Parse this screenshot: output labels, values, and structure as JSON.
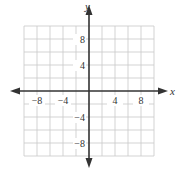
{
  "chart_data": {
    "type": "scatter",
    "title": "",
    "xlabel": "x",
    "ylabel": "y",
    "xlim": [
      -10,
      10
    ],
    "ylim": [
      -10,
      10
    ],
    "grid": true,
    "grid_step": 2,
    "x_ticks": [
      -8,
      -4,
      4,
      8
    ],
    "y_ticks": [
      8,
      4,
      -4,
      -8
    ],
    "x_tick_labels": [
      "−8",
      "−4",
      "4",
      "8"
    ],
    "y_tick_labels": [
      "8",
      "4",
      "−4",
      "−8"
    ],
    "series": [],
    "axis_arrows": true
  },
  "colors": {
    "grid": "#c8c8c8",
    "axis": "#333333",
    "background": "#ffffff"
  }
}
